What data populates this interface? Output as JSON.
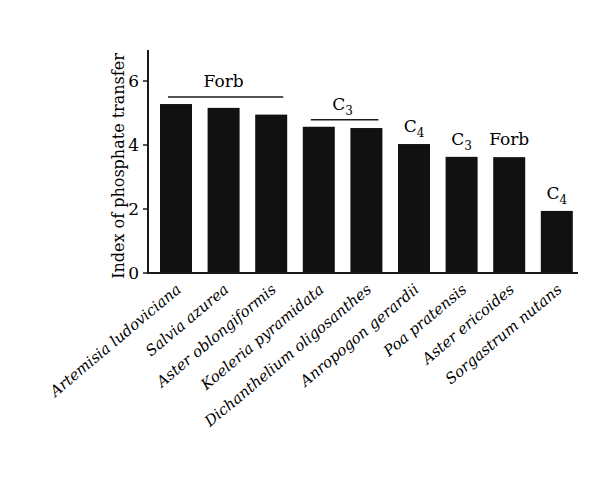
{
  "chart_data": {
    "type": "bar",
    "title": "",
    "xlabel": "",
    "ylabel": "Index of phosphate transfer",
    "ylim": [
      0,
      7
    ],
    "yticks": [
      0,
      2,
      4,
      6
    ],
    "grid": false,
    "legend": null,
    "bar_color": "#111111",
    "categories": [
      "Artemisia ludoviciana",
      "Salvia azurea",
      "Aster oblongiformis",
      "Koeleria pyramidata",
      "Dichanthelium oligosanthes",
      "Anropogon gerardii",
      "Poa pratensis",
      "Aster ericoides",
      "Sorgastrum nutans"
    ],
    "values": [
      5.28,
      5.16,
      4.95,
      4.57,
      4.53,
      4.03,
      3.63,
      3.62,
      1.94
    ],
    "annotations": [
      {
        "text": "Forb",
        "base": "Forb",
        "sub": "",
        "bracket": true,
        "from_index": 0,
        "to_index": 2
      },
      {
        "text": "C3",
        "base": "C",
        "sub": "3",
        "bracket": true,
        "from_index": 3,
        "to_index": 4
      },
      {
        "text": "C4",
        "base": "C",
        "sub": "4",
        "bracket": false,
        "from_index": 5,
        "to_index": 5
      },
      {
        "text": "C3",
        "base": "C",
        "sub": "3",
        "bracket": false,
        "from_index": 6,
        "to_index": 6
      },
      {
        "text": "Forb",
        "base": "Forb",
        "sub": "",
        "bracket": false,
        "from_index": 7,
        "to_index": 7
      },
      {
        "text": "C4",
        "base": "C",
        "sub": "4",
        "bracket": false,
        "from_index": 8,
        "to_index": 8
      }
    ]
  }
}
